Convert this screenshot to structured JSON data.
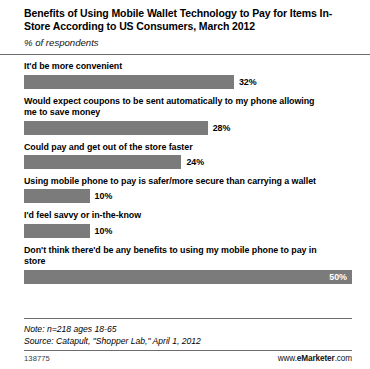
{
  "header": {
    "title": "Benefits of Using Mobile Wallet Technology to Pay for Items In-Store According to US Consumers, March 2012",
    "subtitle": "% of respondents"
  },
  "footer": {
    "note": "Note: n=218 ages 18-65",
    "source": "Source: Catapult, \"Shopper Lab,\" April 1, 2012",
    "id": "138775",
    "brand_prefix": "www.",
    "brand_name": "eMarketer",
    "brand_suffix": ".com"
  },
  "colors": {
    "bar": "#7b7b7b",
    "rule": "#6d6d6d",
    "value_inside": "#ffffff",
    "value_outside": "#000000"
  },
  "chart_data": {
    "type": "bar",
    "orientation": "horizontal",
    "title": "Benefits of Using Mobile Wallet Technology to Pay for Items In-Store According to US Consumers, March 2012",
    "subtitle": "% of respondents",
    "xlabel": "",
    "ylabel": "",
    "xlim": [
      0,
      50
    ],
    "grid": false,
    "legend": false,
    "unit": "%",
    "categories": [
      "It'd be more convenient",
      "Would expect coupons to be sent automatically to my phone allowing me to save money",
      "Could pay and get out of the store faster",
      "Using mobile phone to pay is safer/more secure than carrying a wallet",
      "I'd feel savvy or in-the-know",
      "Don't think there'd be any benefits to using my mobile phone to pay in store"
    ],
    "values": [
      32,
      28,
      24,
      10,
      10,
      50
    ],
    "value_labels": [
      "32%",
      "28%",
      "24%",
      "10%",
      "10%",
      "50%"
    ],
    "label_placement": [
      "outside",
      "outside",
      "outside",
      "outside",
      "outside",
      "inside"
    ],
    "note": "Note: n=218 ages 18-65",
    "source": "Source: Catapult, \"Shopper Lab,\" April 1, 2012"
  }
}
